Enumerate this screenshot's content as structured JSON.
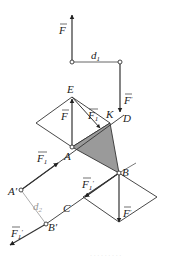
{
  "diagram": {
    "type": "force-couple-vector-diagram",
    "colors": {
      "line": "#333333",
      "shade": "#9a9a9a",
      "thin_line": "#888888"
    },
    "labels": {
      "F_top": "F",
      "d1": "d",
      "d1_sub": "1",
      "F_prime_top": "F",
      "F_prime_top_mark": "′",
      "E": "E",
      "F_mid": "F",
      "F1_mid": "F",
      "F1_mid_sub": "1",
      "K": "K",
      "D": "D",
      "F1_left": "F",
      "F1_left_sub": "1",
      "A": "A",
      "B": "B",
      "A_prime": "A′",
      "d2": "d",
      "d2_sub": "2",
      "F1_prime_right": "F",
      "F1_prime_right_sub": "1",
      "F1_prime_right_mark": "′",
      "C": "C",
      "F_prime_bottom": "F",
      "F_prime_bottom_mark": "′",
      "F1_prime_bottom": "F",
      "F1_prime_bottom_sub": "1",
      "F1_prime_bottom_mark": "′",
      "B_prime": "B′"
    },
    "caption": "· · · · · · · · ·"
  }
}
